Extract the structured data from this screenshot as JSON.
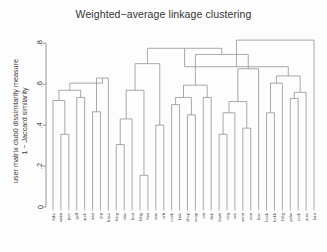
{
  "title": "Weighted−average linkage clustering",
  "ylabel_line1": "user matrix club0 dissimilarity measure",
  "ylabel_line2": "1 − Jaccard similarity",
  "axis": {
    "tick_labels": [
      "0",
      ".2",
      ".4",
      ".6",
      ".8"
    ],
    "tick_values": [
      0,
      0.2,
      0.4,
      0.6,
      0.8
    ]
  },
  "colors": {
    "line": "#8c8c8c",
    "axis": "#8c8c8c",
    "text": "#3a3a3a",
    "background": "#fdfdfd"
  },
  "chart_data": {
    "type": "line",
    "chart_subtype": "dendrogram",
    "title": "Weighted−average linkage clustering",
    "xlabel": "",
    "ylabel": "user matrix club0 dissimilarity measure 1 − Jaccard similarity",
    "ylim": [
      0,
      0.84
    ],
    "grid": false,
    "legend": "none",
    "linkage_method": "weighted-average (WPGMA)",
    "distance_metric": "1 - Jaccard similarity",
    "leaf_labels": [
      "bike",
      "swim",
      "jazz",
      "golf",
      "arch",
      "dart",
      "jog",
      "base",
      "bing",
      "clas",
      "foot",
      "bbig",
      "hist",
      "sew",
      "crft",
      "cook",
      "kids",
      "shop",
      "soap",
      "cat",
      "fish",
      "bowl",
      "dog",
      "crtr",
      "west",
      "rom",
      "horr",
      "hock",
      "bskb",
      "fshg",
      "polw",
      "rock",
      "auto",
      "bird"
    ],
    "n_leaves": 34,
    "merges": [
      {
        "id": "m1",
        "left": "swim",
        "right": "jazz",
        "height": 0.355
      },
      {
        "id": "m2",
        "left": "bike",
        "right": "m1",
        "height": 0.52
      },
      {
        "id": "m3",
        "left": "golf",
        "right": "arch",
        "height": 0.535
      },
      {
        "id": "m4",
        "left": "m2",
        "right": "m3",
        "height": 0.57
      },
      {
        "id": "m5",
        "left": "dart",
        "right": "jog",
        "height": 0.465
      },
      {
        "id": "m6",
        "left": "m5",
        "right": "base",
        "height": 0.63
      },
      {
        "id": "m7",
        "left": "m4",
        "right": "m6",
        "height": 0.605
      },
      {
        "id": "m8",
        "left": "bing",
        "right": "clas",
        "height": 0.305
      },
      {
        "id": "m9",
        "left": "m8",
        "right": "foot",
        "height": 0.43
      },
      {
        "id": "m10",
        "left": "bbig",
        "right": "hist",
        "height": 0.155
      },
      {
        "id": "m11",
        "left": "m9",
        "right": "m10",
        "height": 0.57
      },
      {
        "id": "m12",
        "left": "sew",
        "right": "crft",
        "height": 0.4
      },
      {
        "id": "m13",
        "left": "m11",
        "right": "m12",
        "height": 0.7
      },
      {
        "id": "m14",
        "left": "cook",
        "right": "kids",
        "height": 0.5
      },
      {
        "id": "m15",
        "left": "shop",
        "right": "soap",
        "height": 0.45
      },
      {
        "id": "m16",
        "left": "m14",
        "right": "m15",
        "height": 0.535
      },
      {
        "id": "m17",
        "left": "cat",
        "right": "fish",
        "height": 0.535
      },
      {
        "id": "m18",
        "left": "m16",
        "right": "m17",
        "height": 0.595
      },
      {
        "id": "m19",
        "left": "bowl",
        "right": "dog",
        "height": 0.355
      },
      {
        "id": "m20",
        "left": "m19",
        "right": "crtr",
        "height": 0.46
      },
      {
        "id": "m21",
        "left": "west",
        "right": "rom",
        "height": 0.385
      },
      {
        "id": "m22",
        "left": "m20",
        "right": "m21",
        "height": 0.515
      },
      {
        "id": "m23",
        "left": "m22",
        "right": "horr",
        "height": 0.675
      },
      {
        "id": "m24",
        "left": "m18",
        "right": "m23",
        "height": 0.745
      },
      {
        "id": "m25",
        "left": "m13",
        "right": "m24",
        "height": 0.775
      },
      {
        "id": "m26",
        "left": "hock",
        "right": "bskb",
        "height": 0.46
      },
      {
        "id": "m27",
        "left": "m26",
        "right": "fshg",
        "height": 0.605
      },
      {
        "id": "m28",
        "left": "polw",
        "right": "rock",
        "height": 0.53
      },
      {
        "id": "m29",
        "left": "m28",
        "right": "auto",
        "height": 0.56
      },
      {
        "id": "m30",
        "left": "m27",
        "right": "m29",
        "height": 0.64
      },
      {
        "id": "m31",
        "left": "m25",
        "right": "m30",
        "height": 0.685
      },
      {
        "id": "m32",
        "left": "m31",
        "right": "bird",
        "height": 0.815
      }
    ]
  }
}
